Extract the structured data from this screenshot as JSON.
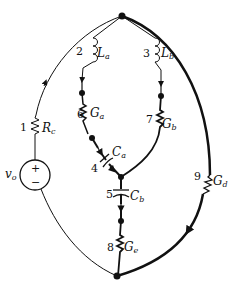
{
  "diagram": {
    "type": "circuit-graph",
    "colors": {
      "ink": "#111111",
      "background": "#ffffff"
    },
    "nodes": [
      {
        "id": "top",
        "x": 122,
        "y": 16
      },
      {
        "id": "bottom",
        "x": 117,
        "y": 276
      },
      {
        "id": "center",
        "x": 121,
        "y": 177
      }
    ],
    "branches": [
      {
        "num": "1",
        "element": "resistor",
        "label": "R",
        "sub": "c"
      },
      {
        "num": "2",
        "element": "inductor",
        "label": "L",
        "sub": "a"
      },
      {
        "num": "3",
        "element": "inductor",
        "label": "L",
        "sub": "b"
      },
      {
        "num": "4",
        "element": "capacitor",
        "label": "C",
        "sub": "a"
      },
      {
        "num": "5",
        "element": "capacitor",
        "label": "C",
        "sub": "b"
      },
      {
        "num": "6",
        "element": "resistor",
        "label": "G",
        "sub": "a"
      },
      {
        "num": "7",
        "element": "resistor",
        "label": "G",
        "sub": "b"
      },
      {
        "num": "8",
        "element": "resistor",
        "label": "G",
        "sub": "e"
      },
      {
        "num": "9",
        "element": "resistor",
        "label": "G",
        "sub": "d"
      }
    ],
    "source": {
      "label": "v",
      "sub": "o",
      "plus": "+",
      "minus": "−"
    }
  }
}
